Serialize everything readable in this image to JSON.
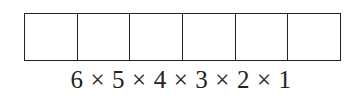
{
  "diagram": {
    "boxes": {
      "count": 6,
      "border_color": "#222222"
    },
    "expression": {
      "factors": [
        "6",
        "5",
        "4",
        "3",
        "2",
        "1"
      ],
      "operator": "×"
    }
  }
}
